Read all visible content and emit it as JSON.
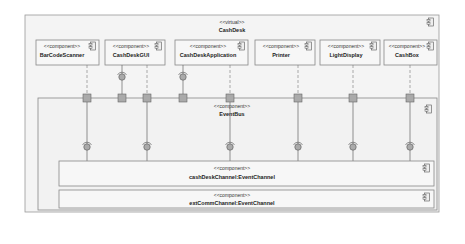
{
  "diagram": {
    "type": "UML component diagram",
    "container": {
      "stereotype": "<<virtual>>",
      "name": "CashDesk"
    },
    "components": [
      {
        "stereotype": "<<component>>",
        "name": "BarCodeScanner"
      },
      {
        "stereotype": "<<component>>",
        "name": "CashDeskGUI"
      },
      {
        "stereotype": "<<component>>",
        "name": "CashDeskApplication"
      },
      {
        "stereotype": "<<component>>",
        "name": "Printer"
      },
      {
        "stereotype": "<<component>>",
        "name": "LightDisplay"
      },
      {
        "stereotype": "<<component>>",
        "name": "CashBox"
      }
    ],
    "bus": {
      "stereotype": "<<component>>",
      "name": "EventBus"
    },
    "channels": [
      {
        "stereotype": "<<component>>",
        "name": "cashDeskChannel:EventChannel"
      },
      {
        "stereotype": "<<component>>",
        "name": "extCommChannel:EventChannel"
      }
    ]
  }
}
